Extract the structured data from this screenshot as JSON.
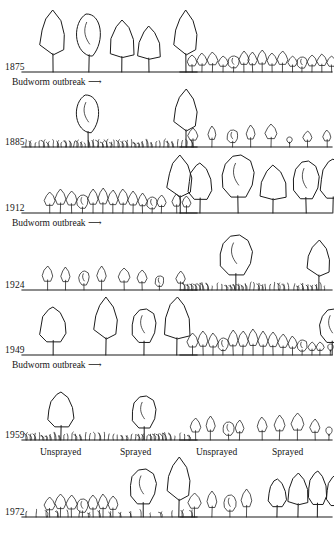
{
  "figure": {
    "kind": "forest-succession-diagram",
    "ink_color": "#1b1b1b",
    "background_color": "#ffffff"
  },
  "rows": [
    {
      "year": "1875",
      "note": "Budworm outbreak ⟶",
      "left": {
        "ground": "bare",
        "trees": [
          {
            "style": "spire",
            "height": 62,
            "width": 26,
            "x": 18
          },
          {
            "style": "round",
            "height": 58,
            "width": 30,
            "x": 52
          },
          {
            "style": "conifer",
            "height": 52,
            "width": 24,
            "x": 88
          },
          {
            "style": "conifer",
            "height": 46,
            "width": 22,
            "x": 116
          },
          {
            "style": "spire",
            "height": 62,
            "width": 24,
            "x": 152
          }
        ]
      },
      "right": {
        "ground": "bare",
        "trees": [
          {
            "style": "sapling",
            "height": 17,
            "width": 10,
            "x": 7
          },
          {
            "style": "sapling",
            "height": 19,
            "width": 10,
            "x": 17
          },
          {
            "style": "sapling",
            "height": 20,
            "width": 11,
            "x": 27
          },
          {
            "style": "sapling",
            "height": 16,
            "width": 10,
            "x": 38
          },
          {
            "style": "blob",
            "height": 16,
            "width": 11,
            "x": 48
          },
          {
            "style": "sapling",
            "height": 21,
            "width": 10,
            "x": 59
          },
          {
            "style": "sapling",
            "height": 20,
            "width": 9,
            "x": 68
          },
          {
            "style": "sapling",
            "height": 22,
            "width": 10,
            "x": 77
          },
          {
            "style": "sapling",
            "height": 19,
            "width": 10,
            "x": 87
          },
          {
            "style": "sapling",
            "height": 21,
            "width": 11,
            "x": 97
          },
          {
            "style": "sapling",
            "height": 16,
            "width": 9,
            "x": 108
          },
          {
            "style": "blob",
            "height": 15,
            "width": 10,
            "x": 117
          },
          {
            "style": "sapling",
            "height": 17,
            "width": 10,
            "x": 127
          },
          {
            "style": "sapling",
            "height": 18,
            "width": 10,
            "x": 137
          },
          {
            "style": "sapling",
            "height": 16,
            "width": 9,
            "x": 147
          }
        ]
      }
    },
    {
      "year": "1885",
      "note": "",
      "left": {
        "ground": "grass",
        "trees": [
          {
            "style": "round",
            "height": 52,
            "width": 28,
            "x": 52
          },
          {
            "style": "spire",
            "height": 58,
            "width": 24,
            "x": 152
          }
        ]
      },
      "right": {
        "ground": "bare",
        "trees": [
          {
            "style": "sapling",
            "height": 19,
            "width": 10,
            "x": 8
          },
          {
            "style": "sapling",
            "height": 21,
            "width": 8,
            "x": 28
          },
          {
            "style": "blob",
            "height": 17,
            "width": 11,
            "x": 47
          },
          {
            "style": "sapling",
            "height": 22,
            "width": 9,
            "x": 66
          },
          {
            "style": "sapling",
            "height": 23,
            "width": 12,
            "x": 85
          },
          {
            "style": "stub",
            "height": 10,
            "width": 7,
            "x": 106
          },
          {
            "style": "sapling",
            "height": 16,
            "width": 9,
            "x": 123
          },
          {
            "style": "sapling",
            "height": 17,
            "width": 8,
            "x": 143
          }
        ]
      }
    },
    {
      "year": "1912",
      "note": "Budworm outbreak ⟶",
      "left": {
        "ground": "bare",
        "trees": [
          {
            "style": "sapling",
            "height": 21,
            "width": 11,
            "x": 22
          },
          {
            "style": "sapling",
            "height": 24,
            "width": 11,
            "x": 33
          },
          {
            "style": "sapling",
            "height": 22,
            "width": 11,
            "x": 44
          },
          {
            "style": "blob",
            "height": 18,
            "width": 11,
            "x": 55
          },
          {
            "style": "sapling",
            "height": 24,
            "width": 10,
            "x": 66
          },
          {
            "style": "sapling",
            "height": 25,
            "width": 10,
            "x": 76
          },
          {
            "style": "sapling",
            "height": 23,
            "width": 10,
            "x": 86
          },
          {
            "style": "sapling",
            "height": 24,
            "width": 10,
            "x": 96
          },
          {
            "style": "sapling",
            "height": 22,
            "width": 10,
            "x": 106
          },
          {
            "style": "sapling",
            "height": 20,
            "width": 9,
            "x": 116
          },
          {
            "style": "blob",
            "height": 16,
            "width": 10,
            "x": 125
          },
          {
            "style": "sapling",
            "height": 18,
            "width": 9,
            "x": 135
          },
          {
            "style": "sapling",
            "height": 19,
            "width": 9,
            "x": 150
          },
          {
            "style": "sapling",
            "height": 17,
            "width": 9,
            "x": 160
          },
          {
            "style": "spire",
            "height": 58,
            "width": 26,
            "x": 145
          }
        ]
      },
      "right": {
        "ground": "bare",
        "trees": [
          {
            "style": "bushy",
            "height": 50,
            "width": 24,
            "x": 8
          },
          {
            "style": "blob",
            "height": 58,
            "width": 32,
            "x": 42
          },
          {
            "style": "conifer",
            "height": 48,
            "width": 26,
            "x": 80
          },
          {
            "style": "blob",
            "height": 52,
            "width": 26,
            "x": 113
          },
          {
            "style": "bushy",
            "height": 54,
            "width": 26,
            "x": 140
          }
        ]
      }
    },
    {
      "year": "1924",
      "note": "",
      "left": {
        "ground": "bare",
        "trees": [
          {
            "style": "sapling",
            "height": 24,
            "width": 11,
            "x": 20
          },
          {
            "style": "sapling",
            "height": 23,
            "width": 9,
            "x": 39
          },
          {
            "style": "blob",
            "height": 19,
            "width": 10,
            "x": 57
          },
          {
            "style": "sapling",
            "height": 24,
            "width": 9,
            "x": 75
          },
          {
            "style": "sapling",
            "height": 22,
            "width": 12,
            "x": 96
          },
          {
            "style": "sapling",
            "height": 20,
            "width": 10,
            "x": 115
          },
          {
            "style": "blob",
            "height": 14,
            "width": 9,
            "x": 133
          },
          {
            "style": "sapling",
            "height": 19,
            "width": 9,
            "x": 154
          }
        ]
      },
      "right": {
        "ground": "grass",
        "trees": [
          {
            "style": "blob",
            "height": 55,
            "width": 32,
            "x": 40
          },
          {
            "style": "spire",
            "height": 50,
            "width": 24,
            "x": 127
          }
        ]
      }
    },
    {
      "year": "1949",
      "note": "Budworm outbreak ⟶",
      "left": {
        "ground": "bare",
        "trees": [
          {
            "style": "bushy",
            "height": 48,
            "width": 26,
            "x": 18
          },
          {
            "style": "spire",
            "height": 58,
            "width": 24,
            "x": 72
          },
          {
            "style": "blob",
            "height": 46,
            "width": 24,
            "x": 110
          },
          {
            "style": "conifer",
            "height": 58,
            "width": 26,
            "x": 142
          }
        ]
      },
      "right": {
        "ground": "bare",
        "trees": [
          {
            "style": "sapling",
            "height": 22,
            "width": 11,
            "x": 7
          },
          {
            "style": "sapling",
            "height": 24,
            "width": 10,
            "x": 18
          },
          {
            "style": "sapling",
            "height": 22,
            "width": 10,
            "x": 28
          },
          {
            "style": "blob",
            "height": 17,
            "width": 10,
            "x": 38
          },
          {
            "style": "sapling",
            "height": 25,
            "width": 10,
            "x": 48
          },
          {
            "style": "sapling",
            "height": 24,
            "width": 10,
            "x": 58
          },
          {
            "style": "sapling",
            "height": 26,
            "width": 10,
            "x": 68
          },
          {
            "style": "sapling",
            "height": 24,
            "width": 10,
            "x": 78
          },
          {
            "style": "sapling",
            "height": 23,
            "width": 10,
            "x": 88
          },
          {
            "style": "sapling",
            "height": 21,
            "width": 10,
            "x": 98
          },
          {
            "style": "sapling",
            "height": 19,
            "width": 9,
            "x": 108
          },
          {
            "style": "blob",
            "height": 15,
            "width": 10,
            "x": 117
          },
          {
            "style": "sapling",
            "height": 13,
            "width": 8,
            "x": 128
          },
          {
            "style": "sapling",
            "height": 13,
            "width": 8,
            "x": 136
          },
          {
            "style": "stub",
            "height": 11,
            "width": 7,
            "x": 147
          },
          {
            "style": "sapling",
            "height": 13,
            "width": 8,
            "x": 156
          },
          {
            "style": "blob",
            "height": 46,
            "width": 24,
            "x": 140
          }
        ]
      }
    },
    {
      "year": "1959",
      "note": "",
      "left": {
        "ground": "grass",
        "trees": [
          {
            "style": "bushy",
            "height": 48,
            "width": 26,
            "x": 26
          },
          {
            "style": "blob",
            "height": 44,
            "width": 24,
            "x": 110
          }
        ]
      },
      "right": {
        "ground": "bare",
        "trees": [
          {
            "style": "sapling",
            "height": 22,
            "width": 11,
            "x": 10
          },
          {
            "style": "sapling",
            "height": 24,
            "width": 9,
            "x": 26
          },
          {
            "style": "blob",
            "height": 18,
            "width": 11,
            "x": 43
          },
          {
            "style": "sapling",
            "height": 20,
            "width": 9,
            "x": 55
          },
          {
            "style": "sapling",
            "height": 23,
            "width": 10,
            "x": 77
          },
          {
            "style": "sapling",
            "height": 25,
            "width": 11,
            "x": 94
          },
          {
            "style": "sapling",
            "height": 27,
            "width": 13,
            "x": 111
          },
          {
            "style": "sapling",
            "height": 21,
            "width": 10,
            "x": 130
          },
          {
            "style": "stub",
            "height": 13,
            "width": 8,
            "x": 145
          }
        ]
      },
      "spray_labels_left": [
        "Unsprayed",
        "Sprayed"
      ],
      "spray_labels_right": [
        "Unsprayed",
        "Sprayed"
      ]
    },
    {
      "year": "1972",
      "note": "",
      "left": {
        "ground": "mixed",
        "trees": [
          {
            "style": "sapling",
            "height": 20,
            "width": 11,
            "x": 22
          },
          {
            "style": "sapling",
            "height": 23,
            "width": 11,
            "x": 33
          },
          {
            "style": "sapling",
            "height": 22,
            "width": 11,
            "x": 44
          },
          {
            "style": "blob",
            "height": 18,
            "width": 11,
            "x": 55
          },
          {
            "style": "sapling",
            "height": 22,
            "width": 10,
            "x": 66
          },
          {
            "style": "sapling",
            "height": 23,
            "width": 10,
            "x": 76
          },
          {
            "style": "sapling",
            "height": 21,
            "width": 10,
            "x": 86
          },
          {
            "style": "blob",
            "height": 48,
            "width": 26,
            "x": 108
          },
          {
            "style": "spire",
            "height": 60,
            "width": 24,
            "x": 145
          }
        ]
      },
      "right": {
        "ground": "bare",
        "trees": [
          {
            "style": "sapling",
            "height": 24,
            "width": 13,
            "x": 8
          },
          {
            "style": "sapling",
            "height": 26,
            "width": 10,
            "x": 27
          },
          {
            "style": "blob",
            "height": 22,
            "width": 12,
            "x": 44
          },
          {
            "style": "sapling",
            "height": 28,
            "width": 11,
            "x": 61
          },
          {
            "style": "bushy",
            "height": 38,
            "width": 18,
            "x": 88
          },
          {
            "style": "conifer",
            "height": 44,
            "width": 20,
            "x": 108
          },
          {
            "style": "bushy",
            "height": 46,
            "width": 19,
            "x": 128
          },
          {
            "style": "bushy",
            "height": 42,
            "width": 19,
            "x": 146
          }
        ]
      }
    }
  ]
}
